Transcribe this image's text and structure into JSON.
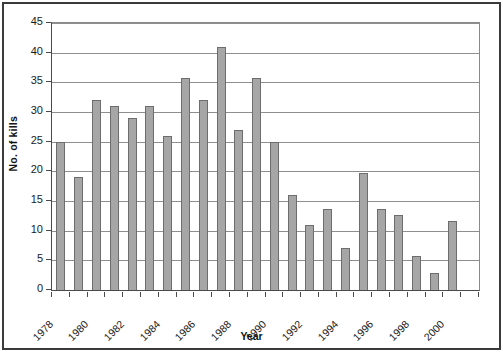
{
  "chart_data": {
    "type": "bar",
    "title": "",
    "xlabel": "Year",
    "ylabel": "No. of kills",
    "categories": [
      "1978",
      "1979",
      "1980",
      "1981",
      "1982",
      "1983",
      "1984",
      "1985",
      "1986",
      "1987",
      "1988",
      "1989",
      "1990",
      "1991",
      "1992",
      "1993",
      "1994",
      "1995",
      "1996",
      "1997",
      "1998",
      "1999",
      "2000",
      "2001"
    ],
    "values": [
      25,
      19,
      32,
      31,
      29,
      31,
      26,
      35.8,
      32,
      41,
      27,
      35.7,
      25,
      16,
      11,
      13.6,
      7,
      19.7,
      13.6,
      12.7,
      5.8,
      2.8,
      11.7,
      0
    ],
    "ylim": [
      0,
      45
    ],
    "ytick_values": [
      0,
      5,
      10,
      15,
      20,
      25,
      30,
      35,
      40,
      45
    ],
    "ytick_labels": [
      "0",
      "5",
      "10",
      "15",
      "20",
      "25",
      "30",
      "35",
      "40",
      "45"
    ],
    "xtick_labels": [
      "1978",
      "1980",
      "1982",
      "1984",
      "1986",
      "1988",
      "1990",
      "1992",
      "1994",
      "1996",
      "1998",
      "2000"
    ],
    "xtick_indices": [
      0,
      2,
      4,
      6,
      8,
      10,
      12,
      14,
      16,
      18,
      20,
      22
    ],
    "grid": true,
    "legend": false,
    "bar_color": "#a6a6a6",
    "bar_border_color": "#6d6d6d",
    "grid_color": "#8e8e8e",
    "axis_color": "#4a4a4a",
    "frame_color": "#3a3a3a",
    "background": "#ffffff"
  }
}
